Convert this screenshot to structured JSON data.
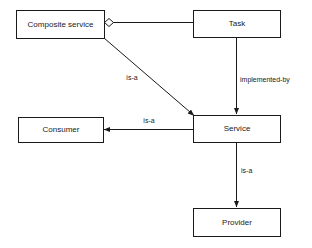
{
  "diagram": {
    "type": "uml-class-relationship-diagram",
    "background_color": "#ffffff",
    "stroke_color": "#1a1a1a",
    "nodes": [
      {
        "id": "composite-service",
        "label": "Composite service",
        "x": 16,
        "y": 10,
        "width": 88,
        "height": 28
      },
      {
        "id": "task",
        "label": "Task",
        "x": 193,
        "y": 10,
        "width": 87,
        "height": 27
      },
      {
        "id": "consumer",
        "label": "Consumer",
        "x": 18,
        "y": 117,
        "width": 85,
        "height": 25
      },
      {
        "id": "service",
        "label": "Service",
        "x": 193,
        "y": 115,
        "width": 87,
        "height": 27
      },
      {
        "id": "provider",
        "label": "Provider",
        "x": 193,
        "y": 208,
        "width": 87,
        "height": 28
      }
    ],
    "edges": [
      {
        "id": "task-aggregated-by-composite-service",
        "from": "task",
        "to": "composite-service",
        "label": "",
        "marker": "aggregation-diamond"
      },
      {
        "id": "composite-service-is-a-service",
        "from": "composite-service",
        "to": "service",
        "label": "is-a",
        "label_x": 132,
        "label_y": 80,
        "marker": "arrow"
      },
      {
        "id": "task-implemented-by-service",
        "from": "task",
        "to": "service",
        "label": "implemented-by",
        "label_x": 240,
        "label_y": 82,
        "marker": "arrow"
      },
      {
        "id": "service-is-a-consumer",
        "from": "service",
        "to": "consumer",
        "label": "is-a",
        "label_x": 149,
        "label_y": 123,
        "marker": "arrow"
      },
      {
        "id": "service-is-a-provider",
        "from": "service",
        "to": "provider",
        "label": "is-a",
        "label_x": 241,
        "label_y": 173,
        "marker": "arrow"
      }
    ]
  }
}
